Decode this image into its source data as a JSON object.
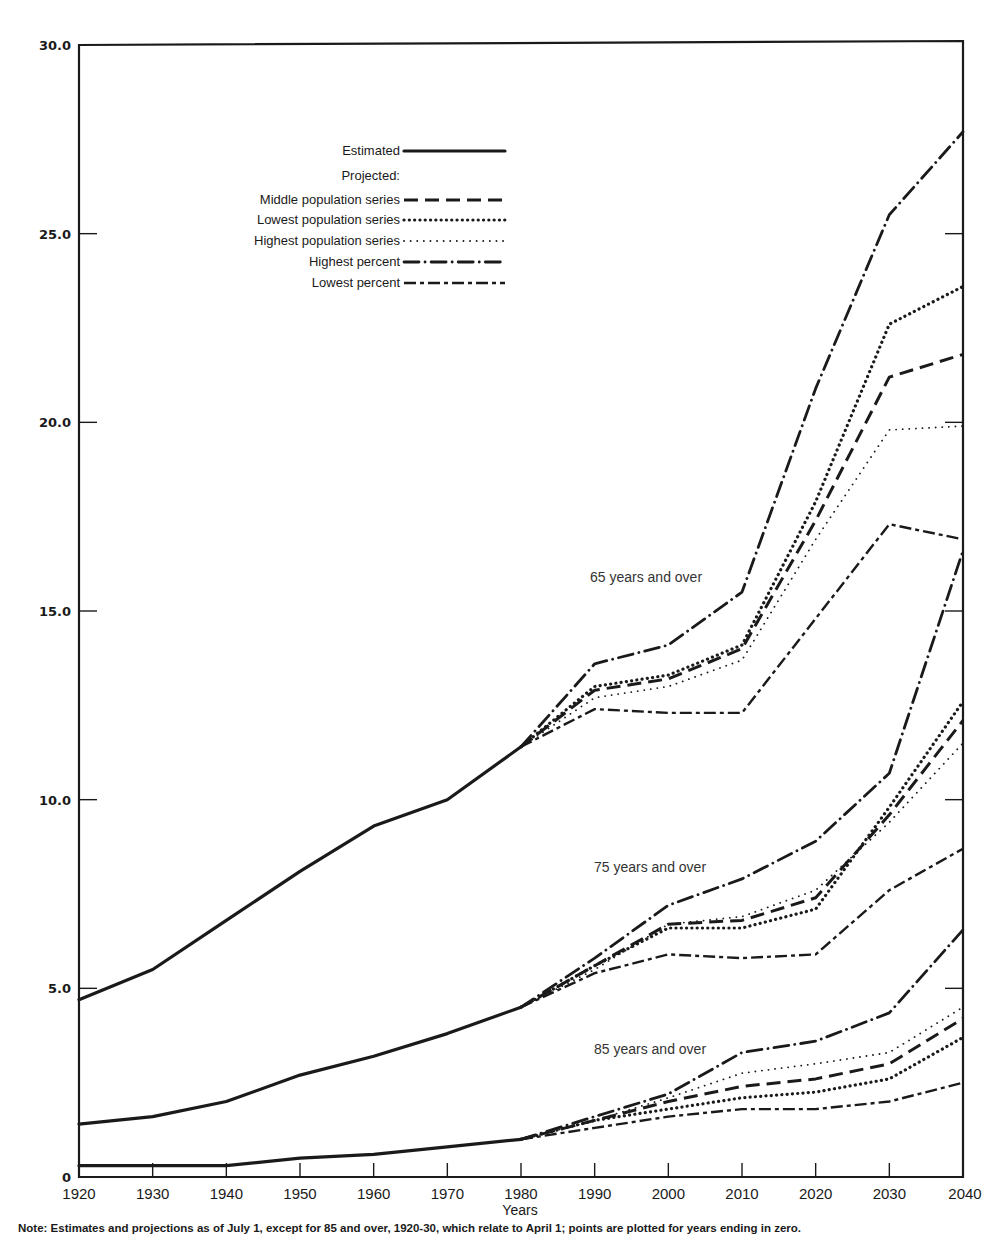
{
  "chart_data": {
    "type": "line",
    "title": "",
    "xlabel": "Years",
    "ylabel": "",
    "ylim": [
      0,
      30
    ],
    "xlim": [
      1920,
      2040
    ],
    "grid": false,
    "legend_position": "upper-left (inside plot)",
    "y_ticks": [
      "0",
      "5.0",
      "10.0",
      "15.0",
      "20.0",
      "25.0",
      "30.0"
    ],
    "y_tick_values": [
      0,
      5,
      10,
      15,
      20,
      25,
      30
    ],
    "x_ticks": [
      "1920",
      "1930",
      "1940",
      "1950",
      "1960",
      "1970",
      "1980",
      "1990",
      "2000",
      "2010",
      "2020",
      "2030",
      "2040"
    ],
    "legend": {
      "estimated": "Estimated",
      "projected_header": "Projected:",
      "middle": "Middle population series",
      "lowest_pop": "Lowest population series",
      "highest_pop": "Highest population series",
      "highest_pct": "Highest percent",
      "lowest_pct": "Lowest percent"
    },
    "annotations": [
      "65 years and over",
      "75 years and over",
      "85 years and over"
    ],
    "groups": [
      {
        "name": "65 years and over",
        "label_pos": [
          590,
          582
        ],
        "estimated": {
          "x": [
            1920,
            1930,
            1940,
            1950,
            1960,
            1970,
            1980
          ],
          "y": [
            4.7,
            5.5,
            6.8,
            8.1,
            9.3,
            10.0,
            11.4
          ]
        },
        "projected_x": [
          1980,
          1990,
          2000,
          2010,
          2020,
          2030,
          2040
        ],
        "series": [
          {
            "name": "Middle population series",
            "style": "middle",
            "y": [
              11.4,
              12.9,
              13.2,
              14.0,
              17.4,
              21.2,
              21.8
            ]
          },
          {
            "name": "Lowest population series",
            "style": "lowest_pop",
            "y": [
              11.4,
              13.0,
              13.3,
              14.1,
              17.9,
              22.6,
              23.6
            ]
          },
          {
            "name": "Highest population series",
            "style": "highest_pop",
            "y": [
              11.4,
              12.7,
              13.0,
              13.7,
              16.9,
              19.8,
              19.9
            ]
          },
          {
            "name": "Highest percent",
            "style": "highest_pct",
            "y": [
              11.4,
              13.6,
              14.1,
              15.5,
              20.9,
              25.5,
              27.7
            ]
          },
          {
            "name": "Lowest percent",
            "style": "lowest_pct",
            "y": [
              11.4,
              12.4,
              12.3,
              12.3,
              14.8,
              17.3,
              16.9
            ]
          }
        ]
      },
      {
        "name": "75 years and over",
        "label_pos": [
          594,
          872
        ],
        "estimated": {
          "x": [
            1920,
            1930,
            1940,
            1950,
            1960,
            1970,
            1980
          ],
          "y": [
            1.4,
            1.6,
            2.0,
            2.7,
            3.2,
            3.8,
            4.5
          ]
        },
        "projected_x": [
          1980,
          1990,
          2000,
          2010,
          2020,
          2030,
          2040
        ],
        "series": [
          {
            "name": "Middle population series",
            "style": "middle",
            "y": [
              4.5,
              5.6,
              6.7,
              6.8,
              7.4,
              9.6,
              12.1
            ]
          },
          {
            "name": "Lowest population series",
            "style": "lowest_pop",
            "y": [
              4.5,
              5.6,
              6.6,
              6.6,
              7.1,
              9.8,
              12.6
            ]
          },
          {
            "name": "Highest population series",
            "style": "highest_pop",
            "y": [
              4.5,
              5.5,
              6.7,
              6.9,
              7.6,
              9.4,
              11.5
            ]
          },
          {
            "name": "Highest percent",
            "style": "highest_pct",
            "y": [
              4.5,
              5.8,
              7.2,
              7.9,
              8.9,
              10.7,
              16.6
            ]
          },
          {
            "name": "Lowest percent",
            "style": "lowest_pct",
            "y": [
              4.5,
              5.4,
              5.9,
              5.8,
              5.9,
              7.6,
              8.7
            ]
          }
        ]
      },
      {
        "name": "85 years and over",
        "label_pos": [
          594,
          1054
        ],
        "estimated": {
          "x": [
            1920,
            1930,
            1940,
            1950,
            1960,
            1970,
            1980
          ],
          "y": [
            0.3,
            0.3,
            0.3,
            0.5,
            0.6,
            0.8,
            1.0
          ]
        },
        "projected_x": [
          1980,
          1990,
          2000,
          2010,
          2020,
          2030,
          2040
        ],
        "series": [
          {
            "name": "Middle population series",
            "style": "middle",
            "y": [
              1.0,
              1.5,
              2.0,
              2.4,
              2.6,
              3.0,
              4.2
            ]
          },
          {
            "name": "Lowest population series",
            "style": "lowest_pop",
            "y": [
              1.0,
              1.5,
              1.8,
              2.1,
              2.25,
              2.6,
              3.7
            ]
          },
          {
            "name": "Highest population series",
            "style": "highest_pop",
            "y": [
              1.0,
              1.5,
              2.1,
              2.75,
              3.0,
              3.3,
              4.5
            ]
          },
          {
            "name": "Highest percent",
            "style": "highest_pct",
            "y": [
              1.0,
              1.6,
              2.2,
              3.3,
              3.6,
              4.35,
              6.55
            ]
          },
          {
            "name": "Lowest percent",
            "style": "lowest_pct",
            "y": [
              1.0,
              1.3,
              1.6,
              1.8,
              1.8,
              2.0,
              2.5
            ]
          }
        ]
      }
    ]
  },
  "note": "Note: Estimates and projections as of July 1, except for 85 and over, 1920-30, which relate to April 1; points are plotted for years ending in zero.",
  "colors": {
    "ink": "#1a1a1a",
    "background": "#ffffff"
  }
}
